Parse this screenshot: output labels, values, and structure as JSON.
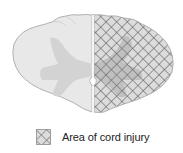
{
  "figure": {
    "regions": [
      {
        "name": "left-hemicord",
        "fill": "#e8e8e8",
        "stroke": "#a9a9a9"
      },
      {
        "name": "right-hemicord-injured",
        "fill": "#dcdcdc",
        "hatch_color": "#5a5a5a",
        "pattern": "crosshatch-diagonal"
      },
      {
        "name": "gray-matter",
        "fill": "#d0d0d0"
      }
    ]
  },
  "legend": {
    "items": [
      {
        "label": "Area of cord injury",
        "pattern": "crosshatch-diagonal",
        "hatch_color": "#5a5a5a",
        "fill": "#dcdcdc"
      }
    ]
  },
  "colors": {
    "background": "#ffffff",
    "outline": "#a9a9a9",
    "white_matter": "#e8e8e8",
    "gray_matter": "#d0d0d0",
    "hatch": "#5a5a5a",
    "text": "#222222"
  }
}
